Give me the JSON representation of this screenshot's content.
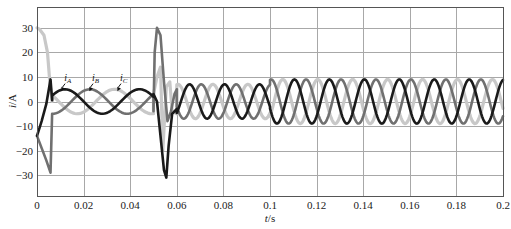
{
  "chart_data": {
    "type": "line",
    "title": "",
    "xlabel": "t/s",
    "ylabel": "i/A",
    "xlim": [
      0,
      0.2
    ],
    "ylim": [
      -38.5,
      38.5
    ],
    "grid": true,
    "legend_position": "inline annotations with arrows near t≈0.01–0.04",
    "x_ticks": [
      0,
      0.02,
      0.04,
      0.06,
      0.08,
      0.1,
      0.12,
      0.14,
      0.16,
      0.18,
      0.2
    ],
    "x_tick_labels": [
      "0",
      "0.02",
      "0.04",
      "0.06",
      "0.08",
      "0.1",
      "0.12",
      "0.14",
      "0.16",
      "0.18",
      "0.2"
    ],
    "y_ticks": [
      30,
      20,
      10,
      0,
      -10,
      -20,
      -30
    ],
    "y_tick_labels": [
      "30",
      "20",
      "10",
      "0",
      "−10",
      "−20",
      "−30"
    ],
    "annotations": [
      {
        "text": "iA",
        "main": "i",
        "sub": "A",
        "x": 0.0125,
        "y": 8.5,
        "arrow_to": [
          0.0105,
          4.2
        ]
      },
      {
        "text": "iB",
        "main": "i",
        "sub": "B",
        "x": 0.0245,
        "y": 8.5,
        "arrow_to": [
          0.0225,
          4.2
        ]
      },
      {
        "text": "iC",
        "main": "i",
        "sub": "C",
        "x": 0.0365,
        "y": 8.5,
        "arrow_to": [
          0.0345,
          4.2
        ]
      }
    ],
    "series": [
      {
        "name": "iA",
        "color": "#1a1a1a",
        "width": 2.6,
        "segments": [
          {
            "type": "points",
            "x": [
              0,
              0.002,
              0.004,
              0.0058
            ],
            "y": [
              -14,
              -8,
              -1,
              9
            ]
          },
          {
            "type": "points",
            "x": [
              0.0058,
              0.0065
            ],
            "y": [
              9,
              0.5
            ]
          },
          {
            "type": "sine",
            "t0": 0.0065,
            "t1": 0.05,
            "amp": 5,
            "period": 0.032,
            "phase_t": 0.012,
            "offset": 0
          },
          {
            "type": "points",
            "x": [
              0.05,
              0.0515,
              0.053,
              0.0545,
              0.0555,
              0.0565,
              0.058,
              0.06
            ],
            "y": [
              3,
              0,
              -14,
              -28,
              -31,
              -18,
              -5,
              -3
            ]
          },
          {
            "type": "sine",
            "t0": 0.06,
            "t1": 0.1,
            "amp": 7,
            "period": 0.015,
            "phase_t": 0.0655,
            "offset": 0
          },
          {
            "type": "sine",
            "t0": 0.1,
            "t1": 0.2,
            "amp": 9,
            "period": 0.015,
            "phase_t": 0.1105,
            "offset": 0
          }
        ]
      },
      {
        "name": "iB",
        "color": "#707070",
        "width": 2.6,
        "segments": [
          {
            "type": "points",
            "x": [
              0,
              0.002,
              0.004,
              0.0058
            ],
            "y": [
              -14,
              -19,
              -24,
              -29
            ]
          },
          {
            "type": "points",
            "x": [
              0.0058,
              0.0065
            ],
            "y": [
              -29,
              -5
            ]
          },
          {
            "type": "sine",
            "t0": 0.0065,
            "t1": 0.05,
            "amp": 5,
            "period": 0.032,
            "phase_t": 0.0227,
            "offset": 0
          },
          {
            "type": "points",
            "x": [
              0.05,
              0.0505,
              0.0515,
              0.053,
              0.0545,
              0.056,
              0.0575,
              0.059,
              0.06
            ],
            "y": [
              -4,
              20,
              30,
              27,
              8,
              -8,
              -4,
              3,
              5
            ]
          },
          {
            "type": "sine",
            "t0": 0.06,
            "t1": 0.1,
            "amp": 7,
            "period": 0.015,
            "phase_t": 0.0705,
            "offset": 0
          },
          {
            "type": "sine",
            "t0": 0.1,
            "t1": 0.2,
            "amp": 9,
            "period": 0.015,
            "phase_t": 0.1155,
            "offset": 0
          }
        ]
      },
      {
        "name": "iC",
        "color": "#c8c8c8",
        "width": 3.2,
        "segments": [
          {
            "type": "points",
            "x": [
              0,
              0.001,
              0.003,
              0.0045,
              0.0055,
              0.0065
            ],
            "y": [
              30,
              29.5,
              27,
              20,
              8,
              0
            ]
          },
          {
            "type": "sine",
            "t0": 0.0065,
            "t1": 0.05,
            "amp": 5,
            "period": 0.032,
            "phase_t": 0.0333,
            "offset": 0
          },
          {
            "type": "points",
            "x": [
              0.05,
              0.0515,
              0.053,
              0.054,
              0.0555,
              0.057,
              0.058,
              0.06
            ],
            "y": [
              3,
              10,
              14,
              -20,
              6,
              8,
              -4,
              -5
            ]
          },
          {
            "type": "sine",
            "t0": 0.06,
            "t1": 0.1,
            "amp": 7,
            "period": 0.015,
            "phase_t": 0.0755,
            "offset": 0
          },
          {
            "type": "sine",
            "t0": 0.1,
            "t1": 0.2,
            "amp": 9,
            "period": 0.015,
            "phase_t": 0.1055,
            "offset": 0
          }
        ]
      }
    ],
    "summary": {
      "interval_0_to_0.05": "startup transient then ~5 A balanced three-phase currents, ~31 Hz",
      "spike_near_0.05": "large transient, iB ≈ +30 A, iA ≈ −31 A",
      "interval_0.06_to_0.1": "~7 A amplitude, ~67 Hz",
      "interval_0.1_to_0.2": "~9 A amplitude, ~67 Hz"
    }
  },
  "axes": {
    "xlabel_main": "t",
    "xlabel_unit": "/s",
    "ylabel_main": "i",
    "ylabel_unit": "/A"
  },
  "layout": {
    "plot_left": 37,
    "plot_right": 503,
    "plot_top": 7,
    "plot_bottom": 196,
    "colors": {
      "grid": "#a8a8a8",
      "frame": "#555555",
      "background": "#ffffff",
      "text": "#222222"
    }
  }
}
